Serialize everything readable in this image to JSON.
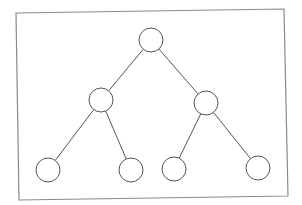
{
  "diagram": {
    "type": "binary-tree",
    "title": "",
    "nodes": [
      {
        "id": "root",
        "label": "",
        "level": 0
      },
      {
        "id": "left",
        "label": "",
        "level": 1,
        "parent": "root"
      },
      {
        "id": "right",
        "label": "",
        "level": 1,
        "parent": "root"
      },
      {
        "id": "left-left",
        "label": "",
        "level": 2,
        "parent": "left"
      },
      {
        "id": "left-right",
        "label": "",
        "level": 2,
        "parent": "left"
      },
      {
        "id": "right-left",
        "label": "",
        "level": 2,
        "parent": "right"
      },
      {
        "id": "right-right",
        "label": "",
        "level": 2,
        "parent": "right"
      }
    ],
    "edges": [
      {
        "from": "root",
        "to": "left"
      },
      {
        "from": "root",
        "to": "right"
      },
      {
        "from": "left",
        "to": "left-left"
      },
      {
        "from": "left",
        "to": "left-right"
      },
      {
        "from": "right",
        "to": "right-left"
      },
      {
        "from": "right",
        "to": "right-right"
      }
    ],
    "colors": {
      "stroke": "#555555",
      "frame": "#8a8a8a",
      "node_fill": "#ffffff",
      "background": "#ffffff"
    }
  }
}
